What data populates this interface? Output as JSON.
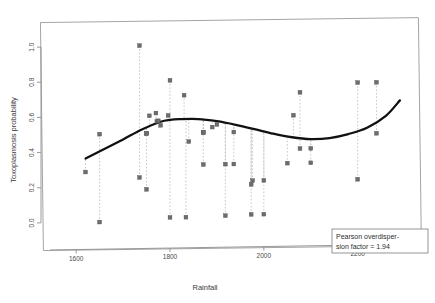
{
  "figure": {
    "background_color": "#ffffff",
    "frame_color": "#9a9a9a",
    "point_color": "#6d6d6d",
    "curve_color": "#111111",
    "dropline_color": "#b9b9b9"
  },
  "legend": {
    "line1": "Pearson overdisper-",
    "line2": "sion factor = 1.94"
  },
  "chart_data": {
    "type": "scatter",
    "title": "",
    "xlabel": "Rainfall",
    "ylabel": "Toxoplasmosis probability",
    "xlim": [
      1540,
      2320
    ],
    "ylim": [
      -0.12,
      1.12
    ],
    "xticks": [
      1600,
      1800,
      2000,
      2200
    ],
    "xtick_labels": [
      "1600",
      "1800",
      "2000",
      "2200"
    ],
    "yticks": [
      0.0,
      0.2,
      0.4,
      0.6,
      0.8,
      1.0
    ],
    "ytick_labels": [
      "0.0",
      "0.2",
      "0.4",
      "0.6",
      "0.8",
      "1.0"
    ],
    "grid": false,
    "legend_position": "bottom-right",
    "series": [
      {
        "name": "Observed proportions",
        "marker": "filled-square",
        "x": [
          1620,
          1650,
          1650,
          1735,
          1735,
          1750,
          1750,
          1750,
          1756,
          1770,
          1772,
          1775,
          1780,
          1796,
          1800,
          1800,
          1830,
          1834,
          1840,
          1871,
          1871,
          1871,
          1890,
          1900,
          1918,
          1918,
          1936,
          1936,
          1973,
          1973,
          1976,
          2000,
          2000,
          2050,
          2063,
          2077,
          2077,
          2100,
          2100,
          2200,
          2200,
          2240,
          2240
        ],
        "y": [
          0.286,
          0.5,
          0.0,
          1.0,
          0.25,
          0.5,
          0.182,
          0.5,
          0.6,
          0.615,
          0.568,
          0.571,
          0.545,
          0.6,
          0.8,
          0.02,
          0.714,
          0.02,
          0.45,
          0.5,
          0.318,
          0.5,
          0.53,
          0.545,
          0.025,
          0.318,
          0.318,
          0.5,
          0.2,
          0.03,
          0.222,
          0.222,
          0.03,
          0.318,
          0.59,
          0.4,
          0.72,
          0.4,
          0.318,
          0.22,
          0.77,
          0.48,
          0.77
        ]
      }
    ],
    "fit_curve": {
      "name": "Fitted smooth (GLM cubic)",
      "x": [
        1620,
        1660,
        1700,
        1740,
        1780,
        1800,
        1820,
        1860,
        1900,
        1940,
        1980,
        2020,
        2060,
        2100,
        2140,
        2180,
        2220,
        2260,
        2290
      ],
      "y": [
        0.363,
        0.415,
        0.468,
        0.523,
        0.565,
        0.575,
        0.578,
        0.577,
        0.563,
        0.541,
        0.515,
        0.487,
        0.465,
        0.453,
        0.457,
        0.478,
        0.512,
        0.578,
        0.665
      ]
    }
  }
}
